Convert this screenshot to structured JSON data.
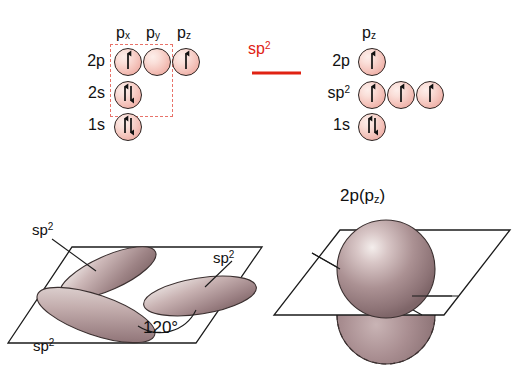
{
  "figure": {
    "colors": {
      "arrow_red": "#e02213",
      "dashed_box_red": "#e8736a",
      "orbital_pink": "#f4c3bb",
      "lobe_mauve": "#9b8184",
      "outline": "#2b2220",
      "background": "#ffffff"
    }
  },
  "left_config": {
    "column_headers": [
      {
        "base": "p",
        "sub": "x"
      },
      {
        "base": "p",
        "sub": "y"
      },
      {
        "base": "p",
        "sub": "z"
      }
    ],
    "rows": [
      {
        "label": "2p",
        "sup": "",
        "electrons": [
          "up",
          "none",
          "up"
        ]
      },
      {
        "label": "2s",
        "sup": "",
        "electrons": [
          "updown"
        ]
      },
      {
        "label": "1s",
        "sup": "",
        "electrons": [
          "updown"
        ]
      }
    ],
    "dashed_box_note": "encloses px, py of 2p and the 2s orbital"
  },
  "transition": {
    "label": "sp",
    "label_sup": "2",
    "arrow": "right-arrow"
  },
  "right_config": {
    "column_headers": [
      {
        "base": "p",
        "sub": "z"
      }
    ],
    "rows": [
      {
        "label": "2p",
        "sup": "",
        "electrons": [
          "up"
        ]
      },
      {
        "label": "sp",
        "sup": "2",
        "electrons": [
          "up",
          "up",
          "up"
        ]
      },
      {
        "label": "1s",
        "sup": "",
        "electrons": [
          "updown"
        ]
      }
    ]
  },
  "lower_left": {
    "caption_labels": [
      {
        "text": "sp",
        "sup": "2",
        "position": "upper-left"
      },
      {
        "text": "sp",
        "sup": "2",
        "position": "right"
      },
      {
        "text": "sp",
        "sup": "2",
        "position": "lower-left"
      }
    ],
    "angle": "120°",
    "description": "three sp2 hybrid orbital lobes in a trigonal planar arrangement"
  },
  "lower_right": {
    "title_base": "2p",
    "title_paren_open": "(",
    "title_p": "p",
    "title_sub": "z",
    "title_paren_close": ")",
    "description": "pz orbital perpendicular to the sp2 plane"
  }
}
